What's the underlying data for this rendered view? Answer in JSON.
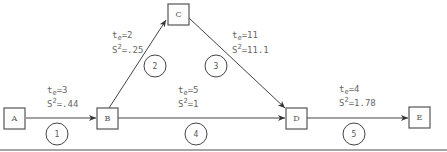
{
  "diagram": {
    "type": "PERT network",
    "nodes": [
      {
        "id": "A",
        "label": "A"
      },
      {
        "id": "B",
        "label": "B"
      },
      {
        "id": "C",
        "label": "C"
      },
      {
        "id": "D",
        "label": "D"
      },
      {
        "id": "E",
        "label": "E"
      }
    ],
    "activities": [
      {
        "number": "1",
        "from": "A",
        "to": "B",
        "te_label": "t",
        "te_sub": "e",
        "te_value": "=3",
        "s_label": "S",
        "s_sup": "2",
        "s_value": "=.44"
      },
      {
        "number": "2",
        "from": "B",
        "to": "C",
        "te_label": "t",
        "te_sub": "e",
        "te_value": "=2",
        "s_label": "S",
        "s_sup": "2",
        "s_value": "=.25"
      },
      {
        "number": "3",
        "from": "C",
        "to": "D",
        "te_label": "t",
        "te_sub": "e",
        "te_value": "=11",
        "s_label": "S",
        "s_sup": "2",
        "s_value": "=11.1"
      },
      {
        "number": "4",
        "from": "B",
        "to": "D",
        "te_label": "t",
        "te_sub": "e",
        "te_value": "=5",
        "s_label": "S",
        "s_sup": "2",
        "s_value": "=1"
      },
      {
        "number": "5",
        "from": "D",
        "to": "E",
        "te_label": "t",
        "te_sub": "e",
        "te_value": "=4",
        "s_label": "S",
        "s_sup": "2",
        "s_value": "=1.78"
      }
    ]
  }
}
